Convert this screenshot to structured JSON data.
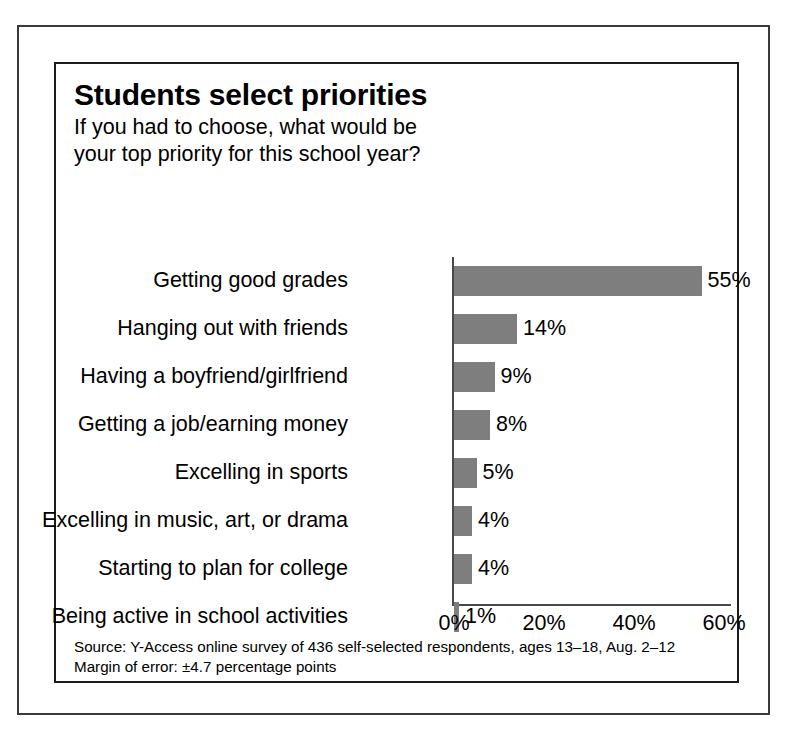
{
  "chart_data": {
    "type": "bar",
    "orientation": "horizontal",
    "title": "Students select priorities",
    "subtitle_lines": [
      "If you had to choose, what would be",
      "your top priority for this school year?"
    ],
    "categories": [
      "Getting good grades",
      "Hanging out with friends",
      "Having a boyfriend/girlfriend",
      "Getting a job/earning money",
      "Excelling in sports",
      "Excelling in music, art, or drama",
      "Starting to plan for college",
      "Being active in school activities"
    ],
    "values": [
      55,
      14,
      9,
      8,
      5,
      4,
      4,
      1
    ],
    "value_labels": [
      "55%",
      "14%",
      "9%",
      "8%",
      "5%",
      "4%",
      "4%",
      "1%"
    ],
    "xlabel": "",
    "ylabel": "",
    "xlim": [
      0,
      62
    ],
    "xticks": [
      0,
      20,
      40,
      60
    ],
    "xtick_labels": [
      "0%",
      "20%",
      "40%",
      "60%"
    ],
    "grid": false,
    "legend": false,
    "bar_color": "#7e7e7e",
    "axis_color": "#4a4a4a",
    "text_color": "#000000",
    "background_color": "#ffffff"
  },
  "footnotes": [
    "Source: Y-Access online survey of 436 self-selected respondents, ages 13–18, Aug. 2–12",
    "Margin of error: ±4.7 percentage points"
  ]
}
